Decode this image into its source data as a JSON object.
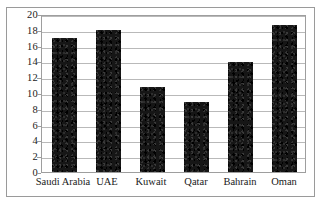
{
  "chart_data": {
    "type": "bar",
    "title": "",
    "subtitle": "",
    "xlabel": "",
    "ylabel": "",
    "categories": [
      "Saudi Arabia",
      "UAE",
      "Kuwait",
      "Qatar",
      "Bahrain",
      "Oman"
    ],
    "values": [
      17.0,
      18.0,
      10.8,
      8.8,
      13.9,
      18.6
    ],
    "ylim": [
      0,
      20
    ],
    "ytick_labels": [
      "0",
      "2",
      "4",
      "6",
      "8",
      "10",
      "12",
      "14",
      "16",
      "18",
      "20"
    ],
    "ytick_values": [
      0,
      2,
      4,
      6,
      8,
      10,
      12,
      14,
      16,
      18,
      20
    ],
    "grid": true,
    "grid_axis": "y",
    "legend": false,
    "legend_position": "none",
    "annotations": [],
    "bar_color": "#161616",
    "grid_color": "#b9b9b9",
    "frame_color": "#9e9e9e",
    "background_color": "#ffffff"
  }
}
